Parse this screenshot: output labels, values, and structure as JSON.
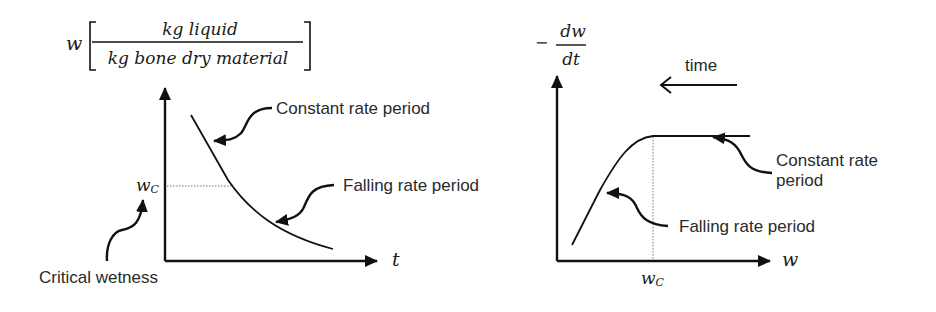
{
  "left_chart": {
    "y_label_var": "w",
    "y_label_numerator": "kg liquid",
    "y_label_denominator": "kg bone  dry material",
    "x_label": "t",
    "critical_label": "w",
    "critical_sub": "C",
    "annotations": {
      "constant": "Constant rate period",
      "falling": "Falling rate period",
      "critical": "Critical wetness"
    }
  },
  "right_chart": {
    "y_label_sign": "−",
    "y_label_numerator": "dw",
    "y_label_denominator": "dt",
    "x_label": "w",
    "critical_label": "w",
    "critical_sub": "C",
    "time_label": "time",
    "annotations": {
      "constant_line1": "Constant rate",
      "constant_line2": "period",
      "falling": "Falling rate period"
    }
  },
  "colors": {
    "line": "#111111",
    "text": "#2a2a2a",
    "dotted": "#777777"
  }
}
